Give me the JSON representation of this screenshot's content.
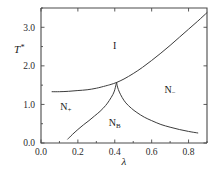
{
  "chart_data": {
    "type": "line",
    "title": "",
    "subtitle": "",
    "xlabel": "λ",
    "ylabel": "T*",
    "xlim": [
      0.0,
      0.9
    ],
    "ylim": [
      0.0,
      3.5
    ],
    "grid": false,
    "legend_position": "none",
    "xticks": [
      0.0,
      0.2,
      0.4,
      0.6,
      0.8
    ],
    "xticklabels": [
      "0.0",
      "0.2",
      "0.4",
      "0.6",
      "0.8"
    ],
    "yticks": [
      0.0,
      1.0,
      2.0,
      3.0
    ],
    "yticklabels": [
      "0.0",
      "1.0",
      "2.0",
      "3.0"
    ],
    "annotations": [
      {
        "text": "I",
        "x": 0.4,
        "y": 2.45
      },
      {
        "text": "N",
        "sub": "+",
        "x": 0.135,
        "y": 0.85
      },
      {
        "text": "N",
        "sub": "−",
        "x": 0.7,
        "y": 1.3
      },
      {
        "text": "N",
        "sub": "B",
        "x": 0.4,
        "y": 0.45
      }
    ],
    "series": [
      {
        "name": "isotropic-nematic boundary",
        "comment": "upper curve separating I from N+ / N-",
        "x": [
          0.06,
          0.1,
          0.15,
          0.2,
          0.25,
          0.3,
          0.35,
          0.38,
          0.41,
          0.45,
          0.5,
          0.55,
          0.6,
          0.65,
          0.7,
          0.75,
          0.8,
          0.85,
          0.9
        ],
        "y": [
          1.33,
          1.33,
          1.34,
          1.36,
          1.38,
          1.42,
          1.48,
          1.52,
          1.57,
          1.66,
          1.8,
          1.96,
          2.14,
          2.33,
          2.53,
          2.74,
          2.95,
          3.16,
          3.38
        ]
      },
      {
        "name": "NB-N+ boundary",
        "comment": "lower-left branch rising to the cusp",
        "x": [
          0.145,
          0.17,
          0.2,
          0.23,
          0.26,
          0.29,
          0.32,
          0.35,
          0.37,
          0.39,
          0.4,
          0.405,
          0.41
        ],
        "y": [
          0.1,
          0.22,
          0.35,
          0.47,
          0.58,
          0.7,
          0.82,
          0.97,
          1.1,
          1.26,
          1.38,
          1.48,
          1.57
        ]
      },
      {
        "name": "NB-N- boundary",
        "comment": "lower-right branch descending from the cusp",
        "x": [
          0.41,
          0.415,
          0.425,
          0.44,
          0.46,
          0.49,
          0.52,
          0.56,
          0.6,
          0.65,
          0.7,
          0.75,
          0.8,
          0.85
        ],
        "y": [
          1.57,
          1.45,
          1.32,
          1.18,
          1.04,
          0.9,
          0.79,
          0.67,
          0.58,
          0.48,
          0.41,
          0.35,
          0.3,
          0.26
        ]
      }
    ]
  },
  "figure": {
    "name": "phase-diagram",
    "axis_color": "#4a4a4a",
    "curve_color": "#3c3c3c",
    "background": "#ffffff"
  }
}
